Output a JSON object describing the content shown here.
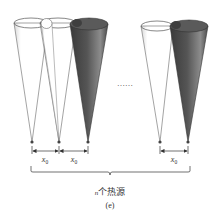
{
  "figure": {
    "panel_label": "(e)",
    "caption": "n个热源",
    "caption_italic_part": "n",
    "caption_rest": "个热源",
    "ellipsis": "……",
    "spacing_label": "x",
    "spacing_subscript": "0",
    "colors": {
      "dark_cone": "#4a4a4a",
      "dark_cone_light": "#8a8a8a",
      "outline": "#555555",
      "text": "#333333"
    },
    "left_group": {
      "cones": [
        {
          "name": "white-cone-1",
          "style": "transparent"
        },
        {
          "name": "white-cone-2",
          "style": "transparent"
        },
        {
          "name": "dark-cone-3",
          "style": "dark"
        }
      ],
      "spacings": [
        "x0",
        "x0"
      ]
    },
    "right_group": {
      "cones": [
        {
          "name": "white-cone-n-1",
          "style": "transparent"
        },
        {
          "name": "dark-cone-n",
          "style": "dark"
        }
      ],
      "spacings": [
        "x0"
      ]
    }
  }
}
